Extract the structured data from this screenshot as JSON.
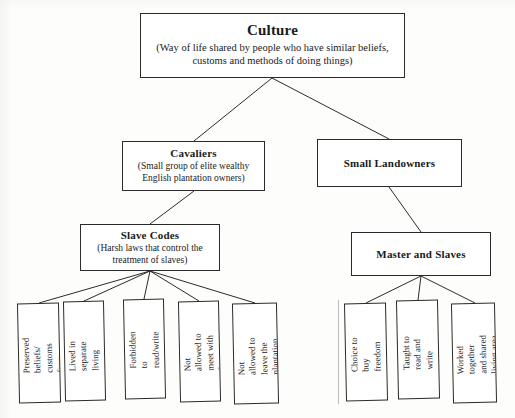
{
  "diagram": {
    "type": "hierarchy-concept-map",
    "root": {
      "title": "Culture",
      "description": "(Way of life shared by people who have similar beliefs, customs and methods of doing things)"
    },
    "level2": [
      {
        "title": "Cavaliers",
        "description": "(Small group of elite wealthy English plantation owners)"
      },
      {
        "title": "Small Landowners",
        "description": ""
      }
    ],
    "level3": [
      {
        "title": "Slave Codes",
        "description": "(Harsh laws that control the treatment of slaves)"
      },
      {
        "title": "Master and Slaves",
        "description": ""
      }
    ],
    "slave_codes_items": [
      "Preserved beliefs/ customs from Africa",
      "Lived in separate living quarters",
      "Forbidden to read/write",
      "Not allowed to meet with free blacks",
      "Not allowed to leave the plantation without permission"
    ],
    "master_slaves_items": [
      "Choice to buy freedom",
      "Taught to read and write",
      "Worked together and shared living area"
    ]
  },
  "style": {
    "line_color": "#2b2b2b",
    "box_fill": "#ffffff",
    "page_background": "#fdfdfb"
  }
}
